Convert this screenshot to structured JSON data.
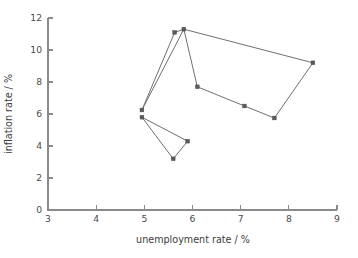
{
  "chart_data": {
    "type": "scatter",
    "title": "",
    "subtitle": "",
    "xlabel": "unemployment rate / %",
    "ylabel": "inflation rate / %",
    "xlim": [
      3,
      9
    ],
    "ylim": [
      0,
      12
    ],
    "xticks": [
      3,
      4,
      5,
      6,
      7,
      8,
      9
    ],
    "yticks": [
      0,
      2,
      4,
      6,
      8,
      10,
      12
    ],
    "xtick_labels": [
      "3",
      "4",
      "5",
      "6",
      "7",
      "8",
      "9"
    ],
    "ytick_labels": [
      "0",
      "2",
      "4",
      "6",
      "8",
      "10",
      "12"
    ],
    "grid": false,
    "legend": false,
    "legend_position": "none",
    "marker_shape": "square",
    "marker_color": "#5a5a5a",
    "line_color": "#6f6f6f",
    "axis_color": "#8a8a8a",
    "connected": true,
    "series": [
      {
        "name": "upper loop",
        "closed": true,
        "points": [
          {
            "x": 4.95,
            "y": 6.25
          },
          {
            "x": 5.63,
            "y": 11.1
          },
          {
            "x": 5.82,
            "y": 11.3
          },
          {
            "x": 8.5,
            "y": 9.2
          },
          {
            "x": 7.7,
            "y": 5.75
          },
          {
            "x": 7.08,
            "y": 6.5
          },
          {
            "x": 6.1,
            "y": 7.7
          },
          {
            "x": 5.82,
            "y": 11.3
          }
        ]
      },
      {
        "name": "lower loop",
        "closed": true,
        "points": [
          {
            "x": 4.95,
            "y": 5.8
          },
          {
            "x": 5.9,
            "y": 4.3
          },
          {
            "x": 5.6,
            "y": 3.2
          },
          {
            "x": 4.95,
            "y": 5.8
          }
        ]
      }
    ],
    "x": [
      4.95,
      5.63,
      5.82,
      8.5,
      7.7,
      7.08,
      6.1,
      4.95,
      5.9,
      5.6
    ],
    "values": [
      6.25,
      11.1,
      11.3,
      9.2,
      5.75,
      6.5,
      7.7,
      5.8,
      4.3,
      3.2
    ]
  }
}
